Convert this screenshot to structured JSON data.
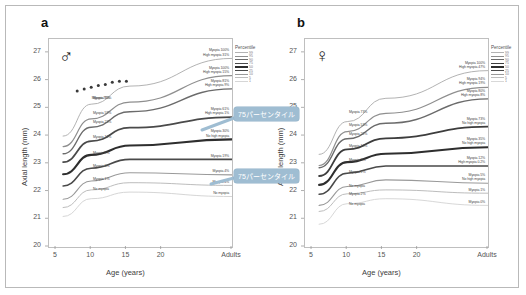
{
  "figure": {
    "axis": {
      "y_title": "Axial length  (mm)",
      "x_title": "Age  (years)",
      "y_ticks": [
        "27",
        "26",
        "25",
        "24",
        "23",
        "22",
        "21",
        "20"
      ],
      "x_ticks": [
        "5",
        "10",
        "15",
        "20",
        "Adults"
      ],
      "ylim": [
        20,
        27.5
      ],
      "xlim": [
        4,
        30
      ]
    },
    "legend": {
      "title": "Percentile",
      "entries": [
        "99",
        "95",
        "90",
        "75",
        "50",
        "25",
        "10",
        "5",
        "1"
      ]
    },
    "callouts": [
      {
        "text": "75パーセンタイル",
        "panel": "a",
        "id": "callout-a-upper"
      },
      {
        "text": "75パーセンタイル",
        "panel": "a",
        "id": "callout-a-lower"
      }
    ]
  },
  "chart_data": {
    "type": "line",
    "xlabel": "Age  (years)",
    "ylabel": "Axial length  (mm)",
    "ylim": [
      20,
      27.5
    ],
    "xlim": [
      4,
      30
    ],
    "grid": false,
    "legend_position": "right-top",
    "x": [
      6,
      10,
      15.5,
      30
    ],
    "x_tick_positions": [
      5,
      10,
      15,
      20,
      30
    ],
    "panels": [
      {
        "id": "a",
        "letter": "a",
        "sex_symbol": "♂",
        "sex": "male",
        "series": [
          {
            "name": "99th percentile",
            "percentile": 99,
            "color": "#b3b3b3",
            "width": 1.0,
            "values": [
              24.0,
              25.15,
              25.8,
              26.8
            ],
            "inline_label": "Myopia 70%",
            "right_label": [
              "Myopia 100%",
              "High myopia 31%"
            ]
          },
          {
            "name": "95th percentile",
            "percentile": 95,
            "color": "#8f8f8f",
            "width": 1.2,
            "values": [
              23.62,
              24.62,
              25.22,
              26.18
            ],
            "inline_label": "Myopia 59%",
            "right_label": [
              "Myopia 100%",
              "High myopia 15%"
            ]
          },
          {
            "name": "90th percentile",
            "percentile": 90,
            "color": "#6b6b6b",
            "width": 1.4,
            "values": [
              23.36,
              24.32,
              24.88,
              25.7
            ],
            "inline_label": "Myopia 23%",
            "right_label": [
              "Myopia 81%",
              "High myopia 9%"
            ]
          },
          {
            "name": "75th percentile",
            "percentile": 75,
            "color": "#4a4a4a",
            "width": 1.8,
            "values": [
              23.06,
              23.82,
              24.3,
              24.68
            ],
            "inline_label": "Myopia 12%",
            "right_label": [
              "Myopia 61%",
              "High myopia 1%"
            ]
          },
          {
            "name": "50th percentile",
            "percentile": 50,
            "color": "#2e2e2e",
            "width": 2.1,
            "values": [
              22.62,
              23.32,
              23.66,
              23.88
            ],
            "inline_label": "Myopia 9%",
            "right_label": [
              "Myopia 30%",
              "No high myopia"
            ]
          },
          {
            "name": "25th percentile",
            "percentile": 25,
            "color": "#4a4a4a",
            "width": 1.6,
            "values": [
              22.2,
              22.84,
              23.16,
              23.16
            ],
            "inline_label": "Myopia 3%",
            "right_label": [
              "Myopia 19%"
            ]
          },
          {
            "name": "10th percentile",
            "percentile": 10,
            "color": "#9a9a9a",
            "width": 1.1,
            "values": [
              21.72,
              22.38,
              22.68,
              22.6
            ],
            "inline_label": "Myopia 1%",
            "right_label": [
              "Myopia 4%"
            ]
          },
          {
            "name": "5th percentile",
            "percentile": 5,
            "color": "#bdbdbd",
            "width": 1.0,
            "values": [
              21.42,
              22.06,
              22.32,
              22.22
            ],
            "inline_label": "No myopia",
            "right_label": [
              "Myopia 4%"
            ]
          },
          {
            "name": "1st percentile",
            "percentile": 1,
            "color": "#d6d6d6",
            "width": 1.0,
            "values": [
              21.1,
              21.74,
              21.98,
              21.82
            ],
            "inline_label": "",
            "right_label": [
              "No myopia"
            ]
          }
        ],
        "marker_series": {
          "name": "observed points",
          "color": "#3a3a3a",
          "x": [
            8,
            9,
            10,
            11,
            12,
            13,
            14,
            15
          ],
          "values": [
            25.62,
            25.7,
            25.76,
            25.82,
            25.86,
            25.94,
            25.98,
            25.98
          ]
        }
      },
      {
        "id": "b",
        "letter": "b",
        "sex_symbol": "♀",
        "sex": "female",
        "series": [
          {
            "name": "99th percentile",
            "percentile": 99,
            "color": "#b3b3b3",
            "width": 1.0,
            "values": [
              23.34,
              24.52,
              25.36,
              26.36
            ],
            "inline_label": "Myopia 73%",
            "right_label": [
              "Myopia 100%",
              "High myopia 47%"
            ]
          },
          {
            "name": "95th percentile",
            "percentile": 95,
            "color": "#8f8f8f",
            "width": 1.2,
            "values": [
              22.94,
              24.16,
              24.82,
              25.76
            ],
            "inline_label": "Myopia 53%",
            "right_label": [
              "Myopia 94%",
              "High myopia 19%"
            ]
          },
          {
            "name": "90th percentile",
            "percentile": 90,
            "color": "#6b6b6b",
            "width": 1.4,
            "values": [
              22.86,
              23.9,
              24.46,
              25.34
            ],
            "inline_label": "Myopia 22%",
            "right_label": [
              "Myopia 80%",
              "High myopia 8%"
            ]
          },
          {
            "name": "75th percentile",
            "percentile": 75,
            "color": "#3d3d3d",
            "width": 1.8,
            "values": [
              22.56,
              23.52,
              23.92,
              24.34
            ],
            "inline_label": "Myopia 13%",
            "right_label": [
              "Myopia 73%",
              "No high myopia"
            ]
          },
          {
            "name": "50th percentile",
            "percentile": 50,
            "color": "#2e2e2e",
            "width": 2.1,
            "values": [
              22.24,
              23.06,
              23.36,
              23.6
            ],
            "inline_label": "Myopia 9%",
            "right_label": [
              "Myopia 35%",
              "No high myopia"
            ]
          },
          {
            "name": "25th percentile",
            "percentile": 25,
            "color": "#4a4a4a",
            "width": 1.6,
            "values": [
              21.9,
              22.66,
              22.92,
              22.92
            ],
            "inline_label": "Myopia 2%",
            "right_label": [
              "Myopia 12%",
              "High myopia 0.2%"
            ]
          },
          {
            "name": "10th percentile",
            "percentile": 10,
            "color": "#9a9a9a",
            "width": 1.1,
            "values": [
              21.5,
              22.18,
              22.42,
              22.3
            ],
            "inline_label": "No myopia",
            "right_label": [
              "Myopia 5%",
              "No high myopia"
            ]
          },
          {
            "name": "5th percentile",
            "percentile": 5,
            "color": "#bdbdbd",
            "width": 1.0,
            "values": [
              21.28,
              21.92,
              22.06,
              21.94
            ],
            "inline_label": "Myopia 2%",
            "right_label": [
              "Myopia 1%"
            ]
          },
          {
            "name": "1st percentile",
            "percentile": 1,
            "color": "#d8d8d8",
            "width": 1.0,
            "values": [
              20.82,
              21.56,
              21.74,
              21.5
            ],
            "inline_label": "No myopia",
            "right_label": [
              "Myopia 0%"
            ]
          }
        ],
        "marker_series": null
      }
    ]
  }
}
